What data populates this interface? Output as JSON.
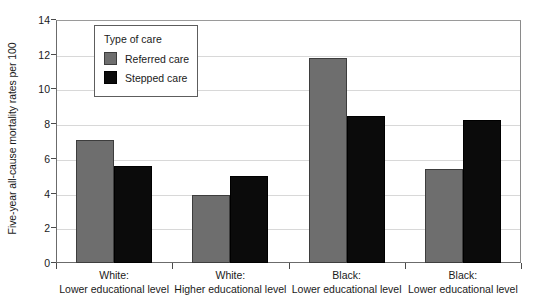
{
  "chart_data": {
    "type": "bar",
    "title": "",
    "xlabel": "",
    "ylabel": "Five-year all-cause mortality rates per 100",
    "ylim": [
      0,
      14
    ],
    "yticks": [
      0,
      2,
      4,
      6,
      8,
      10,
      12,
      14
    ],
    "grid": true,
    "legend_position": "inside-top-left",
    "legend_title": "Type of care",
    "categories": [
      {
        "line1": "White:",
        "line2": "Lower educational level"
      },
      {
        "line1": "White:",
        "line2": "Higher educational level"
      },
      {
        "line1": "Black:",
        "line2": "Lower educational level"
      },
      {
        "line1": "Black:",
        "line2": "Lower educational level"
      }
    ],
    "series": [
      {
        "name": "Referred care",
        "color": "#6e6e6e",
        "values": [
          7.1,
          3.9,
          11.8,
          5.4
        ]
      },
      {
        "name": "Stepped care",
        "color": "#0b0b0b",
        "values": [
          5.6,
          5.0,
          8.45,
          8.25
        ]
      }
    ]
  }
}
